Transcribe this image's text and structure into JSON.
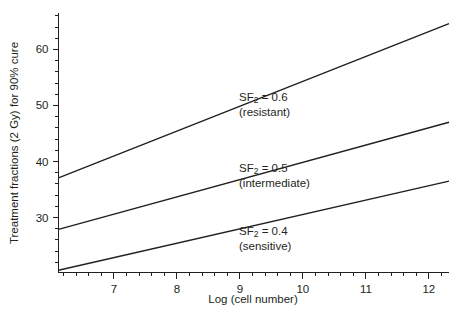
{
  "chart_data": {
    "type": "line",
    "title": "",
    "subtitle": "",
    "xlabel": "Log (cell number)",
    "ylabel": "Treatment fractions (2 Gy) for 90% cure",
    "xlim": [
      6.12,
      12.32
    ],
    "ylim": [
      20.2,
      66.5
    ],
    "grid": false,
    "legend_position": "inline-annotations",
    "x_ticks_major": [
      7,
      8,
      9,
      10,
      11,
      12
    ],
    "x_tick_labels": [
      "7",
      "8",
      "9",
      "10",
      "11",
      "12"
    ],
    "x_tick_minor_step": 0.2,
    "y_ticks_major": [
      30,
      40,
      50,
      60
    ],
    "y_tick_labels": [
      "30",
      "40",
      "50",
      "60"
    ],
    "y_tick_minor_step": 2,
    "series": [
      {
        "name": "SF2 = 0.6 (resistant)",
        "label_main": "SF",
        "label_sub": "2",
        "label_value": " = 0.6",
        "label_paren": "(resistant)",
        "sf2": 0.6,
        "x": [
          6.12,
          12.32
        ],
        "values": [
          37.1,
          64.6
        ],
        "annotation_x": 9.28,
        "annotation_y": 51.0
      },
      {
        "name": "SF2 = 0.5 (intermediate)",
        "label_main": "SF",
        "label_sub": "2",
        "label_value": " = 0.5",
        "label_paren": "(intermediate)",
        "sf2": 0.5,
        "x": [
          6.12,
          12.32
        ],
        "values": [
          27.9,
          47.0
        ],
        "annotation_x": 9.28,
        "annotation_y": 39.0
      },
      {
        "name": "SF2 = 0.4 (sensitive)",
        "label_main": "SF",
        "label_sub": "2",
        "label_value": " = 0.4",
        "label_paren": "(sensitive)",
        "sf2": 0.4,
        "x": [
          6.12,
          12.32
        ],
        "values": [
          20.6,
          36.5
        ],
        "annotation_x": 9.28,
        "annotation_y": 28.4
      }
    ]
  },
  "axes": {
    "y_title": "Treatment fractions (2 Gy) for 90% cure",
    "x_title": "Log (cell number)"
  },
  "annotations": {
    "resistant": {
      "line1_prefix": "SF",
      "line1_sub": "2",
      "line1_suffix": " = 0.6",
      "line2": "(resistant)"
    },
    "intermediate": {
      "line1_prefix": "SF",
      "line1_sub": "2",
      "line1_suffix": " = 0.5",
      "line2": "(intermediate)"
    },
    "sensitive": {
      "line1_prefix": "SF",
      "line1_sub": "2",
      "line1_suffix": " = 0.4",
      "line2": "(sensitive)"
    }
  },
  "colors": {
    "ink": "#231f20",
    "background": "#ffffff"
  }
}
